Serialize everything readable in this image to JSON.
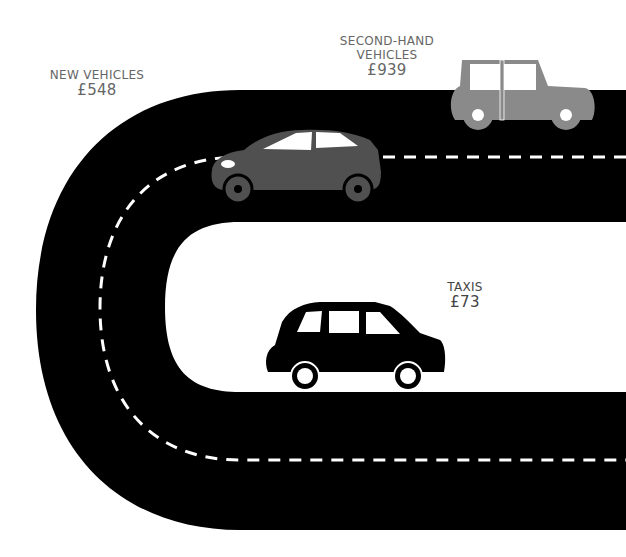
{
  "labels": {
    "new_vehicles": {
      "name": "NEW VEHICLES",
      "price": "£548"
    },
    "second_hand": {
      "name_line1": "SECOND-HAND",
      "name_line2": "VEHICLES",
      "price": "£939"
    },
    "taxis": {
      "name": "TAXIS",
      "price": "£73"
    }
  },
  "colors": {
    "road": "#000000",
    "lane_marking": "#ffffff",
    "new_car": "#505050",
    "second_hand_car": "#8a8a8a",
    "taxi": "#000000",
    "text": "#666666"
  }
}
